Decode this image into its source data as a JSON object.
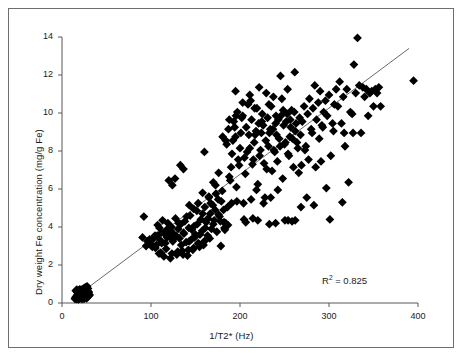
{
  "figure": {
    "border_color": "#6e6e72",
    "background": "#ffffff"
  },
  "chart_data": {
    "type": "scatter",
    "title": "",
    "xlabel": "1/T2* (Hz)",
    "ylabel": "Dry weight Fe concentration (mg/g Fe)",
    "xlim": [
      0,
      400
    ],
    "ylim": [
      0,
      14
    ],
    "xticks": [
      0,
      100,
      200,
      300,
      400
    ],
    "yticks": [
      0,
      2,
      4,
      6,
      8,
      10,
      12,
      14
    ],
    "grid": false,
    "legend": null,
    "marker": "diamond",
    "marker_color": "#000000",
    "marker_size": 4.4,
    "annotations": [
      {
        "text": "R2 = 0.825",
        "display": "R",
        "sup": "2",
        "tail": " = 0.825",
        "x": 300,
        "y": 1.5
      }
    ],
    "fit_line": {
      "type": "linear",
      "color": "#58585c",
      "width": 0.9,
      "x_start": 14,
      "y_start": 0.28,
      "x_end": 390,
      "y_end": 13.4
    },
    "r_squared": 0.825,
    "points": [
      [
        14.5,
        0.22
      ],
      [
        15.2,
        0.3
      ],
      [
        15.8,
        0.26
      ],
      [
        16.4,
        0.35
      ],
      [
        16.9,
        0.41
      ],
      [
        17.3,
        0.28
      ],
      [
        17.8,
        0.52
      ],
      [
        18.2,
        0.33
      ],
      [
        18.6,
        0.46
      ],
      [
        19.0,
        0.57
      ],
      [
        19.4,
        0.38
      ],
      [
        19.8,
        0.62
      ],
      [
        20.1,
        0.44
      ],
      [
        20.5,
        0.55
      ],
      [
        20.8,
        0.31
      ],
      [
        21.2,
        0.67
      ],
      [
        21.5,
        0.48
      ],
      [
        21.9,
        0.59
      ],
      [
        22.2,
        0.36
      ],
      [
        22.6,
        0.71
      ],
      [
        22.9,
        0.5
      ],
      [
        23.3,
        0.63
      ],
      [
        23.6,
        0.42
      ],
      [
        24.0,
        0.75
      ],
      [
        24.3,
        0.54
      ],
      [
        24.7,
        0.66
      ],
      [
        25.0,
        0.45
      ],
      [
        25.4,
        0.8
      ],
      [
        25.7,
        0.58
      ],
      [
        26.1,
        0.69
      ],
      [
        26.4,
        0.48
      ],
      [
        26.8,
        0.84
      ],
      [
        27.1,
        0.61
      ],
      [
        27.5,
        0.72
      ],
      [
        27.8,
        0.51
      ],
      [
        28.2,
        0.88
      ],
      [
        28.5,
        0.64
      ],
      [
        28.9,
        0.4
      ],
      [
        29.2,
        0.76
      ],
      [
        29.6,
        0.55
      ],
      [
        16.1,
        0.2
      ],
      [
        17.0,
        0.24
      ],
      [
        18.0,
        0.29
      ],
      [
        19.2,
        0.35
      ],
      [
        20.3,
        0.4
      ],
      [
        21.0,
        0.26
      ],
      [
        22.0,
        0.33
      ],
      [
        23.0,
        0.38
      ],
      [
        24.5,
        0.31
      ],
      [
        25.5,
        0.36
      ],
      [
        26.5,
        0.42
      ],
      [
        27.2,
        0.34
      ],
      [
        28.0,
        0.45
      ],
      [
        29.0,
        0.5
      ],
      [
        30.1,
        0.58
      ],
      [
        30.6,
        0.44
      ],
      [
        15.5,
        0.64
      ],
      [
        16.6,
        0.7
      ],
      [
        17.5,
        0.58
      ],
      [
        18.9,
        0.66
      ],
      [
        20.0,
        0.72
      ],
      [
        21.7,
        0.6
      ],
      [
        23.8,
        0.68
      ],
      [
        25.2,
        0.74
      ],
      [
        26.0,
        0.3
      ],
      [
        27.7,
        0.25
      ],
      [
        24.8,
        0.22
      ],
      [
        22.4,
        0.21
      ],
      [
        19.6,
        0.23
      ],
      [
        18.4,
        0.19
      ],
      [
        29.8,
        0.35
      ],
      [
        31.0,
        0.42
      ],
      [
        90.5,
        3.45
      ],
      [
        92.0,
        4.55
      ],
      [
        94.5,
        3.0
      ],
      [
        96.0,
        3.25
      ],
      [
        98.5,
        3.35
      ],
      [
        100.2,
        3.1
      ],
      [
        101.5,
        2.95
      ],
      [
        103.0,
        3.4
      ],
      [
        104.5,
        3.55
      ],
      [
        106.0,
        3.05
      ],
      [
        107.5,
        4.1
      ],
      [
        109.0,
        2.6
      ],
      [
        110.5,
        3.3
      ],
      [
        111.8,
        3.7
      ],
      [
        113.0,
        4.35
      ],
      [
        114.5,
        2.45
      ],
      [
        116.0,
        3.15
      ],
      [
        117.5,
        3.85
      ],
      [
        119.0,
        4.2
      ],
      [
        120.5,
        3.5
      ],
      [
        121.8,
        2.35
      ],
      [
        123.0,
        4.0
      ],
      [
        124.5,
        3.25
      ],
      [
        126.0,
        3.6
      ],
      [
        127.5,
        4.45
      ],
      [
        129.0,
        2.55
      ],
      [
        130.5,
        3.9
      ],
      [
        132.0,
        3.4
      ],
      [
        133.5,
        4.15
      ],
      [
        135.0,
        2.75
      ],
      [
        136.5,
        3.7
      ],
      [
        138.0,
        4.3
      ],
      [
        139.5,
        3.2
      ],
      [
        141.0,
        2.5
      ],
      [
        142.5,
        3.95
      ],
      [
        144.0,
        4.6
      ],
      [
        145.5,
        3.35
      ],
      [
        147.0,
        2.8
      ],
      [
        148.5,
        4.05
      ],
      [
        150.0,
        3.6
      ],
      [
        151.5,
        4.85
      ],
      [
        153.0,
        3.15
      ],
      [
        154.5,
        2.95
      ],
      [
        156.0,
        4.4
      ],
      [
        157.5,
        3.8
      ],
      [
        159.0,
        3.05
      ],
      [
        160.5,
        5.05
      ],
      [
        162.0,
        4.25
      ],
      [
        163.5,
        3.55
      ],
      [
        165.0,
        5.6
      ],
      [
        166.5,
        4.7
      ],
      [
        168.0,
        3.9
      ],
      [
        169.5,
        5.15
      ],
      [
        171.0,
        4.35
      ],
      [
        172.5,
        6.2
      ],
      [
        174.0,
        3.75
      ],
      [
        175.5,
        5.45
      ],
      [
        177.0,
        4.55
      ],
      [
        178.5,
        3.0
      ],
      [
        180.0,
        5.9
      ],
      [
        181.5,
        4.9
      ],
      [
        183.0,
        3.85
      ],
      [
        107.0,
        3.55
      ],
      [
        109.5,
        3.95
      ],
      [
        112.0,
        3.15
      ],
      [
        115.0,
        3.65
      ],
      [
        118.0,
        3.45
      ],
      [
        122.0,
        3.8
      ],
      [
        125.0,
        3.35
      ],
      [
        128.0,
        3.55
      ],
      [
        131.0,
        4.2
      ],
      [
        134.0,
        3.05
      ],
      [
        137.0,
        3.65
      ],
      [
        140.0,
        4.55
      ],
      [
        143.0,
        3.25
      ],
      [
        146.0,
        3.85
      ],
      [
        149.0,
        3.45
      ],
      [
        152.0,
        4.15
      ],
      [
        155.0,
        3.6
      ],
      [
        158.0,
        4.7
      ],
      [
        161.0,
        3.95
      ],
      [
        164.0,
        4.45
      ],
      [
        167.0,
        5.25
      ],
      [
        170.0,
        4.15
      ],
      [
        173.0,
        5.75
      ],
      [
        176.0,
        4.65
      ],
      [
        179.0,
        5.35
      ],
      [
        182.0,
        4.25
      ],
      [
        105.0,
        2.9
      ],
      [
        111.0,
        2.65
      ],
      [
        117.0,
        2.85
      ],
      [
        123.5,
        2.6
      ],
      [
        130.0,
        2.7
      ],
      [
        136.0,
        2.55
      ],
      [
        142.0,
        2.8
      ],
      [
        148.0,
        2.9
      ],
      [
        154.0,
        3.1
      ],
      [
        160.0,
        3.25
      ],
      [
        166.0,
        3.4
      ],
      [
        120.0,
        6.45
      ],
      [
        124.0,
        6.2
      ],
      [
        127.0,
        6.55
      ],
      [
        133.0,
        7.25
      ],
      [
        136.5,
        7.05
      ],
      [
        143.0,
        5.15
      ],
      [
        153.0,
        5.25
      ],
      [
        160.0,
        7.95
      ],
      [
        165.0,
        5.55
      ],
      [
        170.0,
        6.35
      ],
      [
        176.0,
        6.85
      ],
      [
        158.0,
        5.8
      ],
      [
        148.0,
        4.95
      ],
      [
        172.0,
        4.9
      ],
      [
        178.0,
        4.3
      ],
      [
        184.0,
        4.2
      ],
      [
        186.0,
        5.05
      ],
      [
        188.0,
        6.65
      ],
      [
        190.0,
        7.15
      ],
      [
        192.0,
        8.55
      ],
      [
        194.0,
        9.25
      ],
      [
        196.0,
        6.1
      ],
      [
        198.0,
        7.55
      ],
      [
        200.0,
        8.15
      ],
      [
        202.0,
        9.75
      ],
      [
        204.0,
        5.25
      ],
      [
        206.0,
        6.8
      ],
      [
        208.0,
        7.95
      ],
      [
        210.0,
        8.85
      ],
      [
        212.0,
        10.65
      ],
      [
        214.0,
        7.3
      ],
      [
        216.0,
        8.45
      ],
      [
        218.0,
        9.05
      ],
      [
        220.0,
        6.25
      ],
      [
        222.0,
        7.75
      ],
      [
        224.0,
        8.95
      ],
      [
        226.0,
        9.35
      ],
      [
        228.0,
        5.55
      ],
      [
        230.0,
        7.05
      ],
      [
        232.0,
        8.25
      ],
      [
        234.0,
        9.15
      ],
      [
        236.0,
        6.95
      ],
      [
        238.0,
        8.05
      ],
      [
        240.0,
        9.45
      ],
      [
        242.0,
        7.45
      ],
      [
        244.0,
        8.65
      ],
      [
        246.0,
        9.85
      ],
      [
        248.0,
        6.55
      ],
      [
        250.0,
        8.35
      ],
      [
        252.0,
        9.55
      ],
      [
        254.0,
        7.85
      ],
      [
        256.0,
        8.75
      ],
      [
        258.0,
        10.15
      ],
      [
        260.0,
        7.15
      ],
      [
        262.0,
        9.05
      ],
      [
        264.0,
        8.45
      ],
      [
        185.0,
        8.35
      ],
      [
        187.0,
        9.15
      ],
      [
        189.0,
        6.45
      ],
      [
        191.0,
        7.85
      ],
      [
        193.0,
        9.55
      ],
      [
        195.0,
        8.75
      ],
      [
        197.0,
        10.05
      ],
      [
        199.0,
        7.25
      ],
      [
        201.0,
        8.95
      ],
      [
        203.0,
        9.85
      ],
      [
        205.0,
        7.65
      ],
      [
        207.0,
        9.25
      ],
      [
        209.0,
        10.45
      ],
      [
        211.0,
        8.15
      ],
      [
        213.0,
        9.65
      ],
      [
        215.0,
        7.55
      ],
      [
        217.0,
        8.85
      ],
      [
        219.0,
        10.25
      ],
      [
        221.0,
        9.45
      ],
      [
        223.0,
        8.05
      ],
      [
        225.0,
        9.95
      ],
      [
        227.0,
        7.35
      ],
      [
        229.0,
        8.55
      ],
      [
        231.0,
        9.75
      ],
      [
        233.0,
        8.95
      ],
      [
        235.0,
        10.35
      ],
      [
        237.0,
        9.15
      ],
      [
        239.0,
        7.95
      ],
      [
        241.0,
        8.85
      ],
      [
        243.0,
        9.65
      ],
      [
        245.0,
        8.25
      ],
      [
        247.0,
        10.75
      ],
      [
        249.0,
        9.35
      ],
      [
        251.0,
        8.45
      ],
      [
        253.0,
        9.95
      ],
      [
        255.0,
        7.75
      ],
      [
        257.0,
        9.25
      ],
      [
        259.0,
        8.65
      ],
      [
        261.0,
        10.05
      ],
      [
        263.0,
        9.45
      ],
      [
        265.0,
        8.15
      ],
      [
        267.0,
        9.75
      ],
      [
        190.5,
        5.25
      ],
      [
        196.5,
        5.35
      ],
      [
        204.5,
        4.4
      ],
      [
        212.5,
        5.45
      ],
      [
        218.5,
        5.95
      ],
      [
        226.5,
        5.25
      ],
      [
        234.5,
        5.55
      ],
      [
        242.5,
        5.95
      ],
      [
        250.5,
        4.35
      ],
      [
        258.5,
        4.3
      ],
      [
        206.5,
        4.25
      ],
      [
        214.5,
        4.45
      ],
      [
        186.5,
        4.1
      ],
      [
        182.5,
        3.95
      ],
      [
        195.0,
        11.15
      ],
      [
        203.0,
        10.55
      ],
      [
        211.0,
        10.95
      ],
      [
        195.5,
        9.85
      ],
      [
        188.0,
        9.65
      ],
      [
        184.0,
        8.55
      ],
      [
        180.5,
        8.75
      ],
      [
        221.5,
        11.35
      ],
      [
        229.5,
        11.05
      ],
      [
        237.5,
        10.85
      ],
      [
        245.5,
        11.95
      ],
      [
        253.5,
        11.25
      ],
      [
        261.5,
        12.15
      ],
      [
        216.5,
        10.25
      ],
      [
        224.5,
        9.55
      ],
      [
        232.5,
        10.45
      ],
      [
        240.5,
        9.85
      ],
      [
        248.5,
        10.15
      ],
      [
        256.5,
        9.65
      ],
      [
        268.0,
        8.85
      ],
      [
        270.0,
        9.55
      ],
      [
        272.0,
        10.35
      ],
      [
        274.0,
        8.25
      ],
      [
        276.0,
        9.95
      ],
      [
        278.0,
        10.75
      ],
      [
        280.0,
        9.15
      ],
      [
        282.0,
        10.25
      ],
      [
        284.0,
        11.45
      ],
      [
        286.0,
        9.65
      ],
      [
        288.0,
        10.55
      ],
      [
        290.0,
        11.15
      ],
      [
        292.0,
        9.35
      ],
      [
        294.0,
        10.05
      ],
      [
        296.0,
        10.65
      ],
      [
        298.0,
        9.85
      ],
      [
        300.0,
        10.95
      ],
      [
        302.0,
        7.75
      ],
      [
        304.0,
        9.45
      ],
      [
        306.0,
        10.45
      ],
      [
        308.0,
        11.25
      ],
      [
        269.0,
        7.25
      ],
      [
        273.0,
        8.05
      ],
      [
        277.0,
        7.55
      ],
      [
        281.0,
        8.95
      ],
      [
        285.0,
        7.15
      ],
      [
        289.0,
        8.65
      ],
      [
        293.0,
        9.25
      ],
      [
        297.0,
        6.05
      ],
      [
        301.0,
        4.4
      ],
      [
        305.0,
        9.05
      ],
      [
        275.0,
        5.55
      ],
      [
        283.0,
        5.15
      ],
      [
        291.0,
        7.45
      ],
      [
        266.0,
        6.85
      ],
      [
        310.0,
        10.35
      ],
      [
        312.0,
        11.65
      ],
      [
        314.0,
        9.45
      ],
      [
        316.0,
        10.85
      ],
      [
        318.0,
        8.25
      ],
      [
        320.0,
        11.25
      ],
      [
        322.0,
        6.35
      ],
      [
        324.0,
        10.05
      ],
      [
        326.0,
        9.95
      ],
      [
        328.0,
        12.55
      ],
      [
        330.0,
        11.05
      ],
      [
        332.0,
        13.95
      ],
      [
        334.0,
        11.45
      ],
      [
        336.0,
        8.95
      ],
      [
        338.0,
        11.35
      ],
      [
        340.0,
        10.85
      ],
      [
        342.0,
        11.25
      ],
      [
        344.0,
        9.85
      ],
      [
        346.0,
        11.05
      ],
      [
        348.0,
        11.15
      ],
      [
        350.0,
        10.35
      ],
      [
        352.0,
        11.25
      ],
      [
        354.0,
        11.05
      ],
      [
        356.0,
        11.35
      ],
      [
        358.0,
        10.35
      ],
      [
        315.0,
        5.3
      ],
      [
        317.0,
        8.95
      ],
      [
        327.0,
        8.95
      ],
      [
        395.0,
        11.7
      ],
      [
        262.0,
        4.35
      ],
      [
        254.0,
        4.35
      ],
      [
        268.5,
        5.05
      ],
      [
        240.0,
        4.2
      ],
      [
        233.0,
        4.15
      ],
      [
        220.0,
        4.35
      ]
    ]
  },
  "axes": {
    "x_tick_labels": [
      "0",
      "100",
      "200",
      "300",
      "400"
    ],
    "y_tick_labels": [
      "0",
      "2",
      "4",
      "6",
      "8",
      "10",
      "12",
      "14"
    ]
  }
}
